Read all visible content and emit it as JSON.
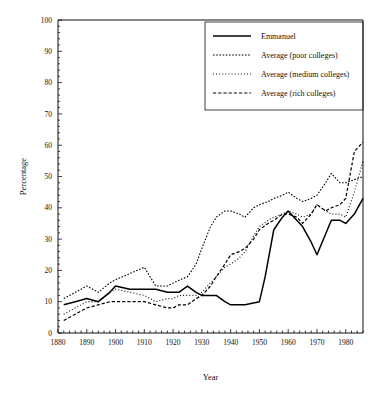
{
  "chart_data": {
    "type": "line",
    "title": "",
    "xlabel": "Year",
    "ylabel": "Percentage",
    "xlim": [
      1880,
      1986
    ],
    "ylim": [
      0,
      100
    ],
    "xticks": [
      1880,
      1890,
      1900,
      1910,
      1920,
      1930,
      1940,
      1950,
      1960,
      1970,
      1980
    ],
    "yticks": [
      0,
      10,
      20,
      30,
      40,
      50,
      60,
      70,
      80,
      90,
      100
    ],
    "xtick_labels": [
      "1880",
      "1890",
      "1900",
      "1910",
      "1920",
      "1930",
      "1940",
      "1950",
      "1960",
      "1970",
      "1980"
    ],
    "ytick_labels": [
      "0",
      "10",
      "20",
      "30",
      "40",
      "50",
      "60",
      "70",
      "80",
      "90",
      "100"
    ],
    "minor_tick_step": 2,
    "grid": false,
    "legend_position": "top-right",
    "series": [
      {
        "name": "Emmanuel",
        "style": "solid",
        "dash": "",
        "width": 1.5,
        "x": [
          1882,
          1886,
          1890,
          1894,
          1898,
          1900,
          1905,
          1910,
          1914,
          1918,
          1922,
          1925,
          1928,
          1930,
          1935,
          1938,
          1940,
          1945,
          1950,
          1952,
          1955,
          1958,
          1960,
          1962,
          1965,
          1968,
          1970,
          1975,
          1978,
          1980,
          1983,
          1986
        ],
        "y": [
          9,
          10,
          11,
          10,
          13,
          15,
          14,
          14,
          14,
          13,
          13,
          15,
          13,
          12,
          12,
          10,
          9,
          9,
          10,
          18,
          33,
          37,
          39,
          37,
          34,
          29,
          25,
          36,
          36,
          35,
          38,
          43
        ]
      },
      {
        "name": "Average (poor colleges)",
        "style": "fine-dotted",
        "dash": "1.6,1.6",
        "width": 1.1,
        "x": [
          1882,
          1886,
          1890,
          1894,
          1898,
          1900,
          1905,
          1910,
          1914,
          1918,
          1920,
          1925,
          1928,
          1930,
          1933,
          1935,
          1938,
          1940,
          1943,
          1945,
          1948,
          1950,
          1953,
          1955,
          1958,
          1960,
          1963,
          1965,
          1968,
          1970,
          1973,
          1975,
          1978,
          1980,
          1983,
          1986
        ],
        "y": [
          11,
          13,
          15,
          13,
          16,
          17,
          19,
          21,
          15,
          15,
          16,
          18,
          22,
          27,
          34,
          37,
          39,
          39,
          38,
          37,
          40,
          41,
          42,
          43,
          44,
          45,
          43,
          42,
          43,
          44,
          48,
          51,
          48,
          48,
          49,
          50
        ]
      },
      {
        "name": "Average (medium colleges)",
        "style": "round-dotted",
        "dash": "0.9,2.2",
        "width": 1.2,
        "x": [
          1882,
          1886,
          1890,
          1894,
          1898,
          1900,
          1905,
          1910,
          1914,
          1918,
          1920,
          1922,
          1925,
          1928,
          1930,
          1933,
          1935,
          1938,
          1940,
          1943,
          1945,
          1948,
          1950,
          1953,
          1955,
          1958,
          1960,
          1963,
          1965,
          1968,
          1970,
          1973,
          1975,
          1978,
          1980,
          1983,
          1986
        ],
        "y": [
          6,
          8,
          10,
          10,
          13,
          14,
          13,
          12,
          10,
          11,
          11,
          12,
          12,
          12,
          13,
          16,
          18,
          21,
          22,
          24,
          26,
          31,
          34,
          36,
          37,
          38,
          39,
          38,
          37,
          38,
          41,
          39,
          38,
          38,
          37,
          45,
          55
        ]
      },
      {
        "name": "Average (rich colleges)",
        "style": "dashed",
        "dash": "3.2,2.0",
        "width": 1.2,
        "x": [
          1882,
          1886,
          1890,
          1894,
          1898,
          1900,
          1905,
          1910,
          1914,
          1918,
          1920,
          1922,
          1925,
          1928,
          1930,
          1933,
          1935,
          1938,
          1940,
          1943,
          1945,
          1948,
          1950,
          1953,
          1955,
          1958,
          1960,
          1963,
          1965,
          1968,
          1970,
          1973,
          1975,
          1978,
          1980,
          1983,
          1986
        ],
        "y": [
          4,
          6,
          8,
          9,
          10,
          10,
          10,
          10,
          9,
          8,
          8,
          9,
          9,
          11,
          12,
          15,
          18,
          22,
          25,
          26,
          27,
          30,
          33,
          35,
          36,
          38,
          38,
          37,
          35,
          38,
          41,
          39,
          40,
          41,
          43,
          58,
          61
        ]
      }
    ]
  },
  "legend": {
    "entries": [
      {
        "label": "Emmanuel"
      },
      {
        "label": "Average (poor colleges)"
      },
      {
        "label": "Average (medium colleges)"
      },
      {
        "label": "Average (rich colleges)"
      }
    ]
  }
}
